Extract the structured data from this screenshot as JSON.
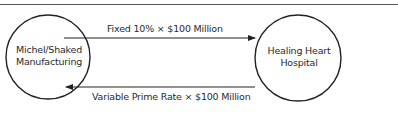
{
  "diagram": {
    "type": "interest-rate-swap",
    "nodes": [
      {
        "id": "left",
        "label_line1": "Michel/Shaked",
        "label_line2": "Manufacturing"
      },
      {
        "id": "right",
        "label_line1": "Healing Heart",
        "label_line2": "Hospital"
      }
    ],
    "flows": [
      {
        "from": "left",
        "to": "right",
        "label": "Fixed 10% × $100 Million"
      },
      {
        "from": "right",
        "to": "left",
        "label": "Variable Prime Rate × $100 Million"
      }
    ],
    "colors": {
      "stroke": "#222222",
      "background": "#ffffff",
      "rule": "#555555"
    }
  }
}
